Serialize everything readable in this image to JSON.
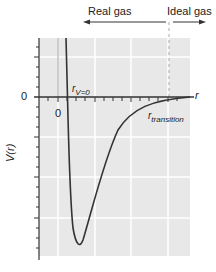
{
  "diagram": {
    "title": "",
    "regions": {
      "real_gas": "Real gas",
      "ideal_gas": "Ideal gas"
    },
    "axes": {
      "y_label": "V(r)",
      "x_label": "r",
      "y_zero_tick": "0",
      "x_zero_tick": "0"
    },
    "annotations": {
      "r_v0_main": "r",
      "r_v0_sub": "V=0",
      "r_transition_main": "r",
      "r_transition_sub": "transition"
    },
    "colors": {
      "plot_bg": "#e8e8e8",
      "grid": "#ffffff",
      "curve": "#333333",
      "axis": "#333333",
      "dashed_line": "#aaaaaa"
    }
  }
}
